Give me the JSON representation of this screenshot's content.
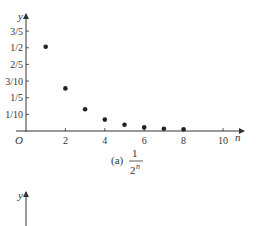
{
  "chart_data": [
    {
      "type": "scatter",
      "title": "(a) 1/2^n",
      "caption_prefix": "(a)",
      "caption_numerator": "1",
      "caption_denominator": "2",
      "caption_exponent": "n",
      "xlabel": "n",
      "ylabel": "y",
      "origin_label": "O",
      "xlim": [
        0,
        10.5
      ],
      "ylim": [
        0,
        0.65
      ],
      "x_ticks": [
        2,
        4,
        6,
        8,
        10
      ],
      "x_tick_labels": [
        "2",
        "4",
        "6",
        "8",
        "10"
      ],
      "y_ticks": [
        0.1,
        0.2,
        0.3,
        0.4,
        0.5,
        0.6
      ],
      "y_tick_labels": [
        "1/10",
        "1/5",
        "3/10",
        "2/5",
        "1/2",
        "3/5"
      ],
      "grid": false,
      "x": [
        1,
        2,
        3,
        4,
        5,
        6,
        7,
        8
      ],
      "values": [
        0.5,
        0.25,
        0.125,
        0.0625,
        0.03125,
        0.015625,
        0.0078125,
        0.00390625
      ]
    },
    {
      "type": "scatter",
      "ylabel": "y",
      "note": "second plot, only top of y-axis visible"
    }
  ]
}
